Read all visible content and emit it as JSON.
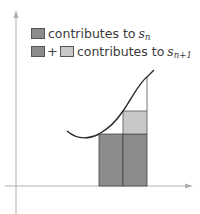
{
  "legend": {
    "items": [
      {
        "swatches": [
          "dark"
        ],
        "text": "contributes to",
        "symbol": "s",
        "subscript": "n"
      },
      {
        "swatches": [
          "dark",
          "light"
        ],
        "joiner": "+",
        "text": "contributes to",
        "symbol": "s",
        "subscript": "n+1"
      }
    ]
  },
  "colors": {
    "dark_fill": "#8c8c8c",
    "light_fill": "#c8c8c8",
    "axis": "#b0b0b0",
    "curve": "#2a2a2a",
    "outline": "#444444"
  },
  "diagram": {
    "rectangles": [
      {
        "x0": 99,
        "x1": 123,
        "top": 134,
        "fill": "dark"
      },
      {
        "x0": 123,
        "x1": 147,
        "top": 134,
        "fill": "dark"
      },
      {
        "x0": 123,
        "x1": 147,
        "top": 111,
        "bottom": 134,
        "fill": "light"
      }
    ]
  }
}
